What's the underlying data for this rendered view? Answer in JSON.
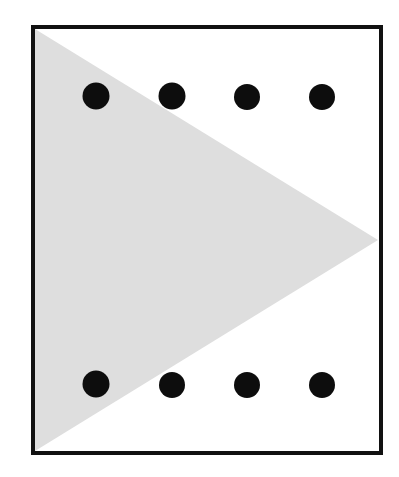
{
  "canvas": {
    "width": 399,
    "height": 477,
    "background_color": "#ffffff",
    "description": "Abstract geometric figure: a light gray right-pointing triangle inside a black rectangular frame, overlaid with eight black dots arranged in two rows of four."
  },
  "frame": {
    "name": "rectangular-border",
    "stroke_color": "#111111",
    "stroke_width": 4,
    "fill_color": "#ffffff",
    "x": 33,
    "y": 27,
    "width": 348,
    "height": 426
  },
  "triangle": {
    "name": "gray-triangle",
    "fill_color": "#dedede",
    "orientation": "pointing-right",
    "points": "35,29 35,451 378,240",
    "vertices": [
      {
        "label": "top-left",
        "x": 35,
        "y": 29
      },
      {
        "label": "bottom-left",
        "x": 35,
        "y": 451
      },
      {
        "label": "apex-right",
        "x": 378,
        "y": 240
      }
    ]
  },
  "dots": {
    "name": "black-dot-grid",
    "fill_color": "#0d0d0d",
    "radius": 13.5,
    "count": 8,
    "rows": 2,
    "columns": 4,
    "row_y": [
      96,
      384
    ],
    "column_x": [
      96,
      172,
      247,
      322
    ],
    "items": [
      {
        "id": "dot-top-1",
        "row": "top",
        "column": 1,
        "cx": 96,
        "cy": 96,
        "r": 13.5,
        "on_gray": true
      },
      {
        "id": "dot-top-2",
        "row": "top",
        "column": 2,
        "cx": 172,
        "cy": 96,
        "r": 13.5,
        "on_gray": true
      },
      {
        "id": "dot-top-3",
        "row": "top",
        "column": 3,
        "cx": 247,
        "cy": 97,
        "r": 13.0,
        "on_gray": false
      },
      {
        "id": "dot-top-4",
        "row": "top",
        "column": 4,
        "cx": 322,
        "cy": 97,
        "r": 13.0,
        "on_gray": false
      },
      {
        "id": "dot-bottom-1",
        "row": "bottom",
        "column": 1,
        "cx": 96,
        "cy": 384,
        "r": 13.5,
        "on_gray": true
      },
      {
        "id": "dot-bottom-2",
        "row": "bottom",
        "column": 2,
        "cx": 172,
        "cy": 385,
        "r": 13.0,
        "on_gray": false
      },
      {
        "id": "dot-bottom-3",
        "row": "bottom",
        "column": 3,
        "cx": 247,
        "cy": 385,
        "r": 13.0,
        "on_gray": false
      },
      {
        "id": "dot-bottom-4",
        "row": "bottom",
        "column": 4,
        "cx": 322,
        "cy": 385,
        "r": 13.0,
        "on_gray": false
      }
    ]
  }
}
